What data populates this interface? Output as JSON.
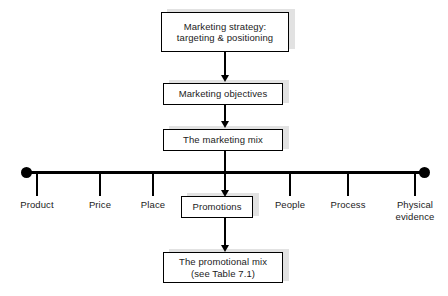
{
  "diagram": {
    "colors": {
      "line": "#000000",
      "box_border": "#000000",
      "box_fill": "#ffffff",
      "shadow": "#e2e2e2",
      "background": "#ffffff",
      "text": "#1b1b1b"
    },
    "boxes": [
      {
        "id": "marketing-strategy",
        "lines": [
          "Marketing strategy:",
          "targeting & positioning"
        ]
      },
      {
        "id": "marketing-objectives",
        "lines": [
          "Marketing objectives"
        ]
      },
      {
        "id": "marketing-mix",
        "lines": [
          "The marketing mix"
        ]
      },
      {
        "id": "promotions",
        "lines": [
          "Promotions"
        ]
      },
      {
        "id": "promotional-mix",
        "lines": [
          "The promotional mix",
          "(see Table 7.1)"
        ]
      }
    ],
    "axis": {
      "name": "seven-ps-axis",
      "end_markers": [
        "left-dot",
        "right-dot"
      ],
      "items": [
        {
          "id": "product",
          "lines": [
            "Product"
          ],
          "x": 37
        },
        {
          "id": "price",
          "lines": [
            "Price"
          ],
          "x": 100
        },
        {
          "id": "place",
          "lines": [
            "Place"
          ],
          "x": 153
        },
        {
          "id": "promotions",
          "lines": [
            "Promotions"
          ],
          "x": 217
        },
        {
          "id": "people",
          "lines": [
            "People"
          ],
          "x": 290
        },
        {
          "id": "process",
          "lines": [
            "Process"
          ],
          "x": 348
        },
        {
          "id": "physical-evidence",
          "lines": [
            "Physical",
            "evidence"
          ],
          "x": 415
        }
      ]
    },
    "connectors": [
      {
        "id": "strategy-to-objectives",
        "arrow": "down"
      },
      {
        "id": "objectives-to-mix",
        "arrow": "down"
      },
      {
        "id": "mix-to-axis",
        "arrow": "none"
      },
      {
        "id": "axis-to-promotions",
        "arrow": "down"
      },
      {
        "id": "promotions-to-promotional-mix",
        "arrow": "down"
      }
    ]
  }
}
